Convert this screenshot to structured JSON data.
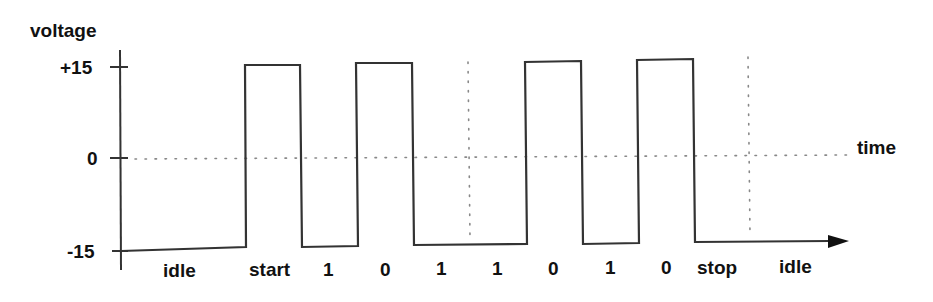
{
  "diagram": {
    "type": "serial-waveform",
    "y_axis": {
      "title": "voltage",
      "ticks": [
        {
          "label": "+15",
          "value": 15
        },
        {
          "label": "0",
          "value": 0
        },
        {
          "label": "-15",
          "value": -15
        }
      ]
    },
    "x_axis": {
      "title": "time"
    },
    "bit_labels": [
      "idle",
      "start",
      "1",
      "0",
      "1",
      "1",
      "0",
      "1",
      "0",
      "stop",
      "idle"
    ],
    "levels": {
      "high": "+15",
      "low": "-15"
    },
    "waveform_sequence": [
      "-15",
      "+15",
      "-15",
      "+15",
      "-15",
      "-15",
      "+15",
      "-15",
      "+15",
      "-15",
      "-15"
    ],
    "colors": {
      "line": "#333333",
      "dotted": "#888888",
      "text": "#111111",
      "background": "#ffffff"
    }
  }
}
